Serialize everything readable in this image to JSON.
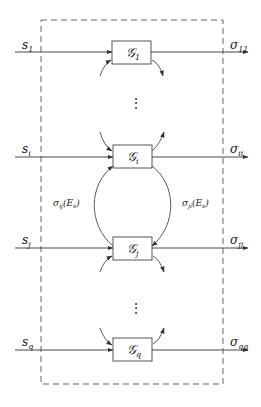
{
  "diagram": {
    "type": "block-diagram",
    "container": {
      "style": "dashed",
      "label": ""
    },
    "blocks": [
      {
        "id": "G1",
        "label": "𝒢",
        "sub": "1",
        "input": "s",
        "input_sub": "1",
        "output": "σ",
        "output_sub": "11"
      },
      {
        "id": "Gi",
        "label": "𝒢",
        "sub": "i",
        "input": "s",
        "input_sub": "i",
        "output": "σ",
        "output_sub": "ii"
      },
      {
        "id": "Gj",
        "label": "𝒢",
        "sub": "j",
        "input": "s",
        "input_sub": "j",
        "output": "σ",
        "output_sub": "jj"
      },
      {
        "id": "Gq",
        "label": "𝒢",
        "sub": "q",
        "input": "s",
        "input_sub": "q",
        "output": "σ",
        "output_sub": "qq"
      }
    ],
    "couplings": [
      {
        "from": "Gj",
        "to": "Gi",
        "label": "σ",
        "label_sub": "ij",
        "arg": "(E",
        "arg_sub": "s",
        "arg_close": ")"
      },
      {
        "from": "Gi",
        "to": "Gj",
        "label": "σ",
        "label_sub": "ji",
        "arg": "(E",
        "arg_sub": "s",
        "arg_close": ")"
      }
    ],
    "ellipsis": [
      "⋮",
      "⋮"
    ]
  }
}
